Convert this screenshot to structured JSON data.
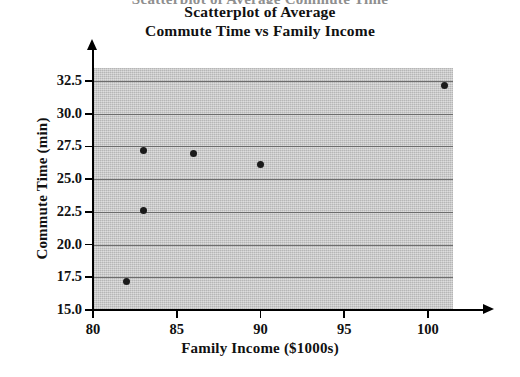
{
  "figure": {
    "clipped_top_text": "Scatterplot of Average Commute Time",
    "title_line_1": "Scatterplot of Average",
    "title_line_2": "Commute Time vs Family Income",
    "plot_background_color": "#c9c9c9",
    "gridline_color": "#6d6d6d",
    "marker_color": "#1b1b1b",
    "axis_color": "#000000"
  },
  "chart_data": {
    "type": "scatter",
    "xlabel": "Family Income ($1000s)",
    "ylabel": "Commute Time (min)",
    "xlim": [
      80,
      101.5
    ],
    "ylim": [
      15.0,
      33.5
    ],
    "grid": true,
    "legend": "none",
    "xticks": [
      80,
      85,
      90,
      95,
      100
    ],
    "xtick_labels": [
      "80",
      "85",
      "90",
      "95",
      "100"
    ],
    "yticks": [
      15.0,
      17.5,
      20.0,
      22.5,
      25.0,
      27.5,
      30.0,
      32.5
    ],
    "ytick_labels": [
      "15.0",
      "17.5",
      "20.0",
      "22.5",
      "25.0",
      "27.5",
      "30.0",
      "32.5"
    ],
    "points": [
      {
        "x": 82,
        "y": 17.2
      },
      {
        "x": 83,
        "y": 22.6
      },
      {
        "x": 83,
        "y": 27.2
      },
      {
        "x": 86,
        "y": 27.0
      },
      {
        "x": 90,
        "y": 26.1
      },
      {
        "x": 101,
        "y": 32.2
      }
    ]
  }
}
